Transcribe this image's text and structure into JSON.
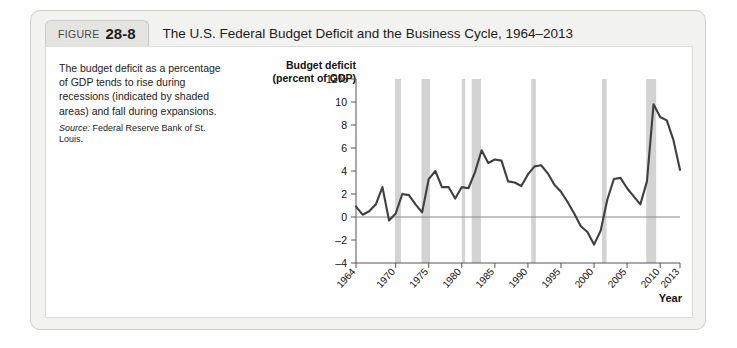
{
  "figure": {
    "label": "FIGURE",
    "number": "28-8",
    "title": "The U.S. Federal Budget Deficit and the Business Cycle, 1964–2013"
  },
  "caption": {
    "body": "The budget deficit as a percentage of GDP tends to rise during recessions (indicated by shaded areas) and fall during expansions.",
    "source_label": "Source:",
    "source_text": " Federal Reserve Bank of St. Louis."
  },
  "chart_data": {
    "type": "line",
    "title": "",
    "ylabel_line1": "Budget deficit",
    "ylabel_line2": "(percent of GDP)",
    "xlabel": "Year",
    "xlim": [
      1964,
      2013
    ],
    "ylim": [
      -4,
      12
    ],
    "ytick_labels": [
      "12%",
      "10",
      "8",
      "6",
      "4",
      "2",
      "0",
      "–2",
      "–4"
    ],
    "ytick_values": [
      12,
      10,
      8,
      6,
      4,
      2,
      0,
      -2,
      -4
    ],
    "xtick_labels": [
      "1964",
      "1970",
      "1975",
      "1980",
      "1985",
      "1990",
      "1995",
      "2000",
      "2005",
      "2010",
      "2013"
    ],
    "xtick_values": [
      1964,
      1970,
      1975,
      1980,
      1985,
      1990,
      1995,
      2000,
      2005,
      2010,
      2013
    ],
    "grid": false,
    "legend": "none",
    "zero_line": 0,
    "line_color": "#3f3f3f",
    "recession_color": "#d3d3d3",
    "series": [
      {
        "name": "Federal budget deficit (percent of GDP)",
        "x": [
          1964,
          1965,
          1966,
          1967,
          1968,
          1969,
          1970,
          1971,
          1972,
          1973,
          1974,
          1975,
          1976,
          1977,
          1978,
          1979,
          1980,
          1981,
          1982,
          1983,
          1984,
          1985,
          1986,
          1987,
          1988,
          1989,
          1990,
          1991,
          1992,
          1993,
          1994,
          1995,
          1996,
          1997,
          1998,
          1999,
          2000,
          2001,
          2002,
          2003,
          2004,
          2005,
          2006,
          2007,
          2008,
          2009,
          2010,
          2011,
          2012,
          2013
        ],
        "values": [
          0.9,
          0.2,
          0.5,
          1.1,
          2.6,
          -0.3,
          0.3,
          2.0,
          1.9,
          1.1,
          0.4,
          3.3,
          4.0,
          2.6,
          2.6,
          1.6,
          2.6,
          2.5,
          3.9,
          5.8,
          4.7,
          5.0,
          4.9,
          3.1,
          3.0,
          2.7,
          3.7,
          4.4,
          4.5,
          3.8,
          2.8,
          2.2,
          1.3,
          0.3,
          -0.8,
          -1.3,
          -2.4,
          -1.2,
          1.5,
          3.3,
          3.4,
          2.5,
          1.8,
          1.1,
          3.1,
          9.8,
          8.7,
          8.4,
          6.7,
          4.1
        ]
      }
    ],
    "recession_bands": [
      {
        "start": 1969.9,
        "end": 1970.8
      },
      {
        "start": 1973.9,
        "end": 1975.2
      },
      {
        "start": 1980.0,
        "end": 1980.5
      },
      {
        "start": 1981.5,
        "end": 1982.9
      },
      {
        "start": 1990.5,
        "end": 1991.2
      },
      {
        "start": 2001.2,
        "end": 2001.9
      },
      {
        "start": 2007.9,
        "end": 2009.4
      }
    ]
  }
}
